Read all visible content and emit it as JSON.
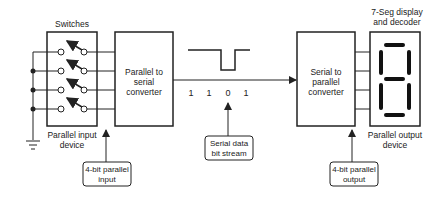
{
  "labels": {
    "switches": "Switches",
    "p2s_line1": "Parallel to",
    "p2s_line2": "serial",
    "p2s_line3": "converter",
    "s2p_line1": "Serial to",
    "s2p_line2": "parallel",
    "s2p_line3": "converter",
    "display_line1": "7-Seg display",
    "display_line2": "and decoder",
    "input_device_line1": "Parallel input",
    "input_device_line2": "device",
    "output_device_line1": "Parallel output",
    "output_device_line2": "device"
  },
  "callouts": {
    "parallel_input_line1": "4-bit parallel",
    "parallel_input_line2": "input",
    "serial_stream_line1": "Serial data",
    "serial_stream_line2": "bit stream",
    "parallel_output_line1": "4-bit parallel",
    "parallel_output_line2": "output"
  },
  "bits": [
    "1",
    "1",
    "0",
    "1"
  ],
  "display_digit": "8",
  "colors": {
    "line": "#222222",
    "text": "#222222",
    "background": "#ffffff"
  }
}
